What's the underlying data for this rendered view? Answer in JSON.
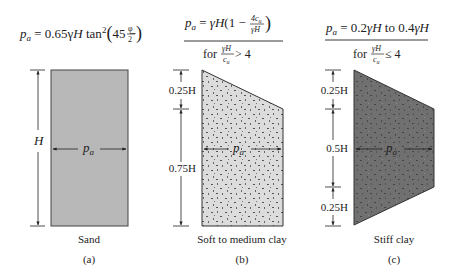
{
  "panels": [
    {
      "id": "a",
      "formula": "p_a = 0.65 γH tan²(45 − φ/2)",
      "formula_parts": {
        "lhs": "p",
        "sub": "a",
        "eq": " = 0.65",
        "gamma": "γ",
        "H": "H",
        "tan": " tan",
        "sq": "2",
        "paren_open": "(",
        "num45": "45 − ",
        "phi": "φ",
        "two": "2",
        "paren_close": ")"
      },
      "dimension_label": "H",
      "pressure_label": "p",
      "pressure_sub": "a",
      "soil": "Sand",
      "caption": "(a)",
      "fill": "#b8b8b8"
    },
    {
      "id": "b",
      "formula_line1": {
        "lhs": "p",
        "sub": "a",
        "eq": " = ",
        "gH": "γH",
        "open": "(1 − ",
        "frac_num": "4c",
        "frac_num_sub": "u",
        "frac_den": "γH",
        "close": ")"
      },
      "formula_line2": {
        "for": "for ",
        "frac_num": "γH",
        "frac_den": "c",
        "frac_den_sub": "u",
        "cond": " > 4"
      },
      "dimension_labels": [
        "0.25H",
        "0.75H"
      ],
      "pressure_label": "p",
      "pressure_sub": "a",
      "soil": "Soft to medium clay",
      "caption": "(b)",
      "fill": "#d8d8d8"
    },
    {
      "id": "c",
      "formula_line1": {
        "lhs": "p",
        "sub": "a",
        "eq": " = 0.2",
        "gH1": "γH",
        "to": " to 0.4",
        "gH2": "γH"
      },
      "formula_line2": {
        "for": "for ",
        "frac_num": "γH",
        "frac_den": "c",
        "frac_den_sub": "u",
        "cond": " ≤ 4"
      },
      "dimension_labels": [
        "0.25H",
        "0.5H",
        "0.25H"
      ],
      "pressure_label": "p",
      "pressure_sub": "a",
      "soil": "Stiff clay",
      "caption": "(c)",
      "fill": "#6e6e6e"
    }
  ]
}
